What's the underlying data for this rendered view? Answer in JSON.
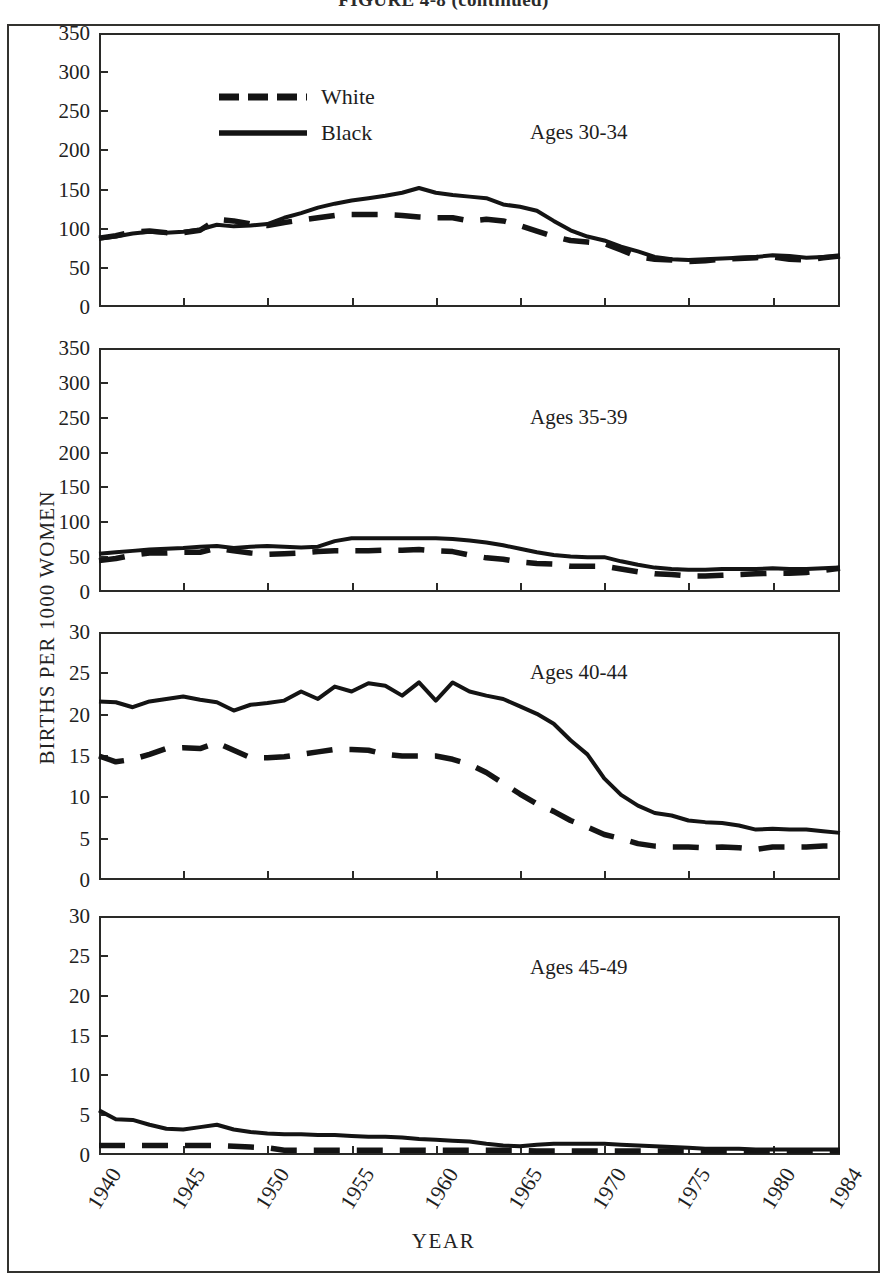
{
  "figure": {
    "caption": "FIGURE 4-8 (continued)",
    "x_axis_title": "YEAR",
    "y_axis_title": "BIRTHS PER 1000 WOMEN"
  },
  "legend": {
    "position": "top-left-panel-1",
    "entries": [
      {
        "label": "White",
        "style": "dashed",
        "color": "#141414"
      },
      {
        "label": "Black",
        "style": "solid",
        "color": "#141414"
      }
    ]
  },
  "xticks": [
    "1940",
    "1945",
    "1950",
    "1955",
    "1960",
    "1965",
    "1970",
    "1975",
    "1980",
    "1984"
  ],
  "chart_data": [
    {
      "type": "line",
      "title": "Ages 30-34",
      "xlabel": "YEAR",
      "ylabel": "BIRTHS PER 1000 WOMEN",
      "xlim": [
        1940,
        1984
      ],
      "ylim": [
        0,
        350
      ],
      "yticks": [
        0,
        50,
        100,
        150,
        200,
        250,
        300,
        350
      ],
      "grid": false,
      "x": [
        1940,
        1941,
        1942,
        1943,
        1944,
        1945,
        1946,
        1947,
        1948,
        1949,
        1950,
        1951,
        1952,
        1953,
        1954,
        1955,
        1956,
        1957,
        1958,
        1959,
        1960,
        1961,
        1962,
        1963,
        1964,
        1965,
        1966,
        1967,
        1968,
        1969,
        1970,
        1971,
        1972,
        1973,
        1974,
        1975,
        1976,
        1977,
        1978,
        1979,
        1980,
        1981,
        1982,
        1983,
        1984
      ],
      "series": [
        {
          "name": "White",
          "style": "dashed",
          "values": [
            88,
            91,
            96,
            97,
            95,
            95,
            98,
            112,
            110,
            106,
            104,
            108,
            111,
            114,
            117,
            118,
            118,
            118,
            117,
            115,
            114,
            114,
            110,
            112,
            110,
            104,
            97,
            90,
            85,
            83,
            81,
            73,
            64,
            61,
            60,
            58,
            59,
            61,
            62,
            63,
            64,
            61,
            60,
            63,
            65
          ]
        },
        {
          "name": "Black",
          "style": "solid",
          "values": [
            87,
            90,
            94,
            96,
            95,
            96,
            99,
            105,
            103,
            104,
            106,
            114,
            120,
            127,
            132,
            136,
            139,
            142,
            146,
            152,
            146,
            143,
            141,
            139,
            131,
            128,
            123,
            110,
            98,
            90,
            85,
            77,
            71,
            64,
            61,
            60,
            61,
            62,
            63,
            64,
            66,
            65,
            63,
            64,
            65
          ]
        }
      ]
    },
    {
      "type": "line",
      "title": "Ages 35-39",
      "xlabel": "YEAR",
      "ylabel": "BIRTHS PER 1000 WOMEN",
      "xlim": [
        1940,
        1984
      ],
      "ylim": [
        0,
        350
      ],
      "yticks": [
        0,
        50,
        100,
        150,
        200,
        250,
        300,
        350
      ],
      "grid": false,
      "x": [
        1940,
        1941,
        1942,
        1943,
        1944,
        1945,
        1946,
        1947,
        1948,
        1949,
        1950,
        1951,
        1952,
        1953,
        1954,
        1955,
        1956,
        1957,
        1958,
        1959,
        1960,
        1961,
        1962,
        1963,
        1964,
        1965,
        1966,
        1967,
        1968,
        1969,
        1970,
        1971,
        1972,
        1973,
        1974,
        1975,
        1976,
        1977,
        1978,
        1979,
        1980,
        1981,
        1982,
        1983,
        1984
      ],
      "series": [
        {
          "name": "White",
          "style": "dashed",
          "values": [
            45,
            48,
            53,
            56,
            56,
            57,
            57,
            63,
            59,
            56,
            54,
            55,
            56,
            58,
            59,
            59,
            59,
            60,
            60,
            61,
            59,
            58,
            53,
            49,
            47,
            43,
            41,
            40,
            37,
            37,
            37,
            33,
            29,
            26,
            25,
            23,
            23,
            24,
            25,
            26,
            27,
            27,
            28,
            31,
            34
          ]
        },
        {
          "name": "Black",
          "style": "solid",
          "values": [
            55,
            57,
            59,
            61,
            62,
            63,
            65,
            66,
            63,
            65,
            66,
            65,
            64,
            65,
            73,
            77,
            77,
            77,
            77,
            77,
            77,
            76,
            74,
            71,
            67,
            62,
            57,
            53,
            51,
            50,
            50,
            44,
            39,
            35,
            33,
            32,
            32,
            33,
            33,
            33,
            34,
            33,
            33,
            34,
            35
          ]
        }
      ]
    },
    {
      "type": "line",
      "title": "Ages 40-44",
      "xlabel": "YEAR",
      "ylabel": "BIRTHS PER 1000 WOMEN",
      "xlim": [
        1940,
        1984
      ],
      "ylim": [
        0,
        30
      ],
      "yticks": [
        0,
        5,
        10,
        15,
        20,
        25,
        30
      ],
      "grid": false,
      "x": [
        1940,
        1941,
        1942,
        1943,
        1944,
        1945,
        1946,
        1947,
        1948,
        1949,
        1950,
        1951,
        1952,
        1953,
        1954,
        1955,
        1956,
        1957,
        1958,
        1959,
        1960,
        1961,
        1962,
        1963,
        1964,
        1965,
        1966,
        1967,
        1968,
        1969,
        1970,
        1971,
        1972,
        1973,
        1974,
        1975,
        1976,
        1977,
        1978,
        1979,
        1980,
        1981,
        1982,
        1983,
        1984
      ],
      "series": [
        {
          "name": "White",
          "style": "dashed",
          "values": [
            15.0,
            14.3,
            14.6,
            15.2,
            15.9,
            16.0,
            15.9,
            16.6,
            15.7,
            14.8,
            14.8,
            14.9,
            15.2,
            15.5,
            15.8,
            15.8,
            15.7,
            15.2,
            15.0,
            15.0,
            15.0,
            14.6,
            14.0,
            13.0,
            11.7,
            10.4,
            9.2,
            8.3,
            7.2,
            6.4,
            5.5,
            5.0,
            4.4,
            4.1,
            4.0,
            4.0,
            3.9,
            4.0,
            3.9,
            3.7,
            4.0,
            4.0,
            4.0,
            4.1,
            4.1
          ]
        },
        {
          "name": "Black",
          "style": "solid",
          "values": [
            21.6,
            21.5,
            20.9,
            21.6,
            21.9,
            22.2,
            21.8,
            21.5,
            20.5,
            21.2,
            21.4,
            21.7,
            22.8,
            21.9,
            23.4,
            22.8,
            23.8,
            23.5,
            22.3,
            23.9,
            21.7,
            23.9,
            22.8,
            22.3,
            21.9,
            21.0,
            20.1,
            18.9,
            16.9,
            15.2,
            12.3,
            10.3,
            9.0,
            8.1,
            7.8,
            7.2,
            7.0,
            6.9,
            6.6,
            6.1,
            6.2,
            6.1,
            6.1,
            5.9,
            5.7
          ]
        }
      ]
    },
    {
      "type": "line",
      "title": "Ages 45-49",
      "xlabel": "YEAR",
      "ylabel": "BIRTHS PER 1000 WOMEN",
      "xlim": [
        1940,
        1984
      ],
      "ylim": [
        0,
        30
      ],
      "yticks": [
        0,
        5,
        10,
        15,
        20,
        25,
        30
      ],
      "grid": false,
      "x": [
        1940,
        1941,
        1942,
        1943,
        1944,
        1945,
        1946,
        1947,
        1948,
        1949,
        1950,
        1951,
        1952,
        1953,
        1954,
        1955,
        1956,
        1957,
        1958,
        1959,
        1960,
        1961,
        1962,
        1963,
        1964,
        1965,
        1966,
        1967,
        1968,
        1969,
        1970,
        1971,
        1972,
        1973,
        1974,
        1975,
        1976,
        1977,
        1978,
        1979,
        1980,
        1981,
        1982,
        1983,
        1984
      ],
      "series": [
        {
          "name": "White",
          "style": "dashed",
          "values": [
            1.2,
            1.2,
            1.2,
            1.2,
            1.2,
            1.2,
            1.2,
            1.2,
            1.1,
            1.0,
            0.9,
            0.6,
            0.6,
            0.6,
            0.6,
            0.6,
            0.6,
            0.6,
            0.6,
            0.6,
            0.6,
            0.6,
            0.6,
            0.6,
            0.6,
            0.6,
            0.5,
            0.5,
            0.5,
            0.5,
            0.5,
            0.5,
            0.5,
            0.5,
            0.5,
            0.5,
            0.5,
            0.5,
            0.5,
            0.5,
            0.5,
            0.5,
            0.5,
            0.5,
            0.5
          ]
        },
        {
          "name": "Black",
          "style": "solid",
          "values": [
            5.6,
            4.5,
            4.4,
            3.8,
            3.3,
            3.2,
            3.5,
            3.8,
            3.2,
            2.9,
            2.7,
            2.6,
            2.6,
            2.5,
            2.5,
            2.4,
            2.3,
            2.3,
            2.2,
            2.0,
            1.9,
            1.8,
            1.7,
            1.4,
            1.2,
            1.1,
            1.3,
            1.4,
            1.4,
            1.4,
            1.4,
            1.3,
            1.2,
            1.1,
            1.0,
            0.9,
            0.8,
            0.8,
            0.8,
            0.7,
            0.7,
            0.7,
            0.7,
            0.7,
            0.7
          ]
        }
      ]
    }
  ]
}
